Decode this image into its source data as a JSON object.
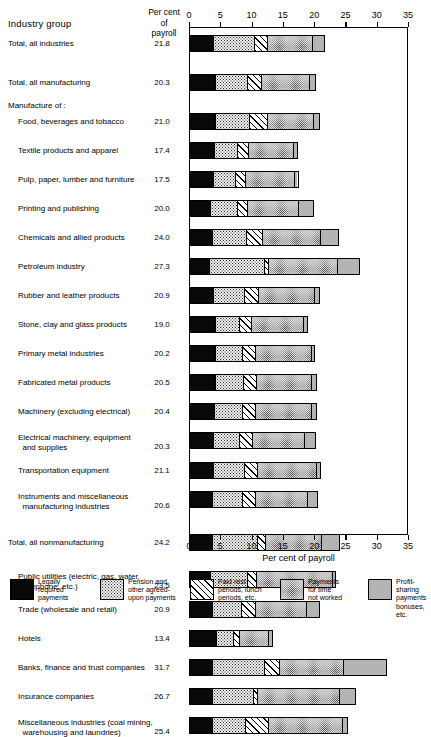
{
  "header": {
    "industry_group": "Industry group",
    "percent_of_payroll_l1": "Per cent",
    "percent_of_payroll_l2": "of",
    "percent_of_payroll_l3": "payroll"
  },
  "axis": {
    "caption": "Per cent of payroll",
    "ticks": [
      0,
      5,
      10,
      15,
      20,
      25,
      30,
      35
    ],
    "min": 0,
    "max": 35
  },
  "legend": {
    "items": [
      {
        "name": "legally-required",
        "label": "Legally\nrequired\npayments",
        "pattern": "p-legal",
        "color": "#080808"
      },
      {
        "name": "pension-agreed",
        "label": "Pension and\nother agreed-\nupon payments",
        "pattern": "p-pension",
        "color": "#f2f2f2"
      },
      {
        "name": "paid-rest",
        "label": "Paid rest\nperiods, lunch\nperiods, etc.",
        "pattern": "p-rest",
        "color": "#ffffff"
      },
      {
        "name": "time-not-worked",
        "label": "Payments\nfor time\nnot worked",
        "pattern": "p-time",
        "color": "#dedede"
      },
      {
        "name": "profit-sharing",
        "label": "Profit-sharing\npayments\nbonuses, etc.",
        "pattern": "p-profit",
        "color": "#b4b4b4"
      }
    ]
  },
  "group_headings": [
    {
      "label": "Manufacture of :",
      "after_row": 1
    }
  ],
  "chart_data": {
    "type": "bar",
    "orientation": "horizontal",
    "stacked": true,
    "title": "",
    "xlabel": "Per cent of payroll",
    "ylabel": "Industry group",
    "xlim": [
      0,
      35
    ],
    "grid": false,
    "legend_position": "bottom",
    "series": [
      {
        "name": "Legally required payments",
        "pattern": "p-legal"
      },
      {
        "name": "Pension and other agreed-upon payments",
        "pattern": "p-pension"
      },
      {
        "name": "Paid rest periods, lunch periods, etc.",
        "pattern": "p-rest"
      },
      {
        "name": "Payments for time not worked",
        "pattern": "p-time"
      },
      {
        "name": "Profit-sharing payments bonuses, etc.",
        "pattern": "p-profit"
      }
    ],
    "rows": [
      {
        "label": "Total, all industries",
        "indent": 0,
        "total": "21.8",
        "segments": [
          3.8,
          6.6,
          2.1,
          7.3,
          2.0
        ]
      },
      {
        "label": "Total, all manufacturing",
        "indent": 0,
        "total": "20.3",
        "segments": [
          4.0,
          5.2,
          2.3,
          7.8,
          1.0
        ]
      },
      {
        "label": "Food, beverages and tobacco",
        "indent": 1,
        "total": "21.0",
        "segments": [
          4.0,
          5.5,
          3.0,
          7.5,
          1.0
        ]
      },
      {
        "label": "Textile products and apparel",
        "indent": 1,
        "total": "17.4",
        "segments": [
          3.9,
          3.8,
          1.8,
          7.2,
          0.7
        ]
      },
      {
        "label": "Pulp, paper, lumber and furniture",
        "indent": 1,
        "total": "17.5",
        "segments": [
          3.8,
          3.6,
          1.6,
          8.0,
          0.5
        ]
      },
      {
        "label": "Printing and publishing",
        "indent": 1,
        "total": "20.0",
        "segments": [
          3.3,
          4.3,
          1.7,
          8.3,
          2.4
        ]
      },
      {
        "label": "Chemicals and allied products",
        "indent": 1,
        "total": "24.0",
        "segments": [
          3.6,
          5.4,
          2.6,
          9.4,
          3.0
        ]
      },
      {
        "label": "Petroleum industry",
        "indent": 1,
        "total": "27.3",
        "segments": [
          3.0,
          9.0,
          0.6,
          11.2,
          3.5
        ]
      },
      {
        "label": "Rubber and leather products",
        "indent": 1,
        "total": "20.9",
        "segments": [
          3.7,
          5.1,
          2.3,
          9.0,
          0.8
        ]
      },
      {
        "label": "Stone, clay and glass products",
        "indent": 1,
        "total": "19.0",
        "segments": [
          4.0,
          3.9,
          2.0,
          8.5,
          0.6
        ]
      },
      {
        "label": "Primary metal industries",
        "indent": 1,
        "total": "20.2",
        "segments": [
          4.1,
          4.4,
          2.0,
          9.1,
          0.6
        ]
      },
      {
        "label": "Fabricated metal products",
        "indent": 1,
        "total": "20.5",
        "segments": [
          4.0,
          4.6,
          2.1,
          9.0,
          0.8
        ]
      },
      {
        "label": "Machinery (excluding electrical)",
        "indent": 1,
        "total": "20.4",
        "segments": [
          3.9,
          4.6,
          2.0,
          9.2,
          0.7
        ]
      },
      {
        "label": "Electrical machinery, equipment\n  and supplies",
        "indent": 1,
        "total": "20.3",
        "segments": [
          3.8,
          4.2,
          2.1,
          8.4,
          1.8
        ]
      },
      {
        "label": "Transportation equipment",
        "indent": 1,
        "total": "21.1",
        "segments": [
          3.8,
          4.9,
          2.2,
          9.5,
          0.7
        ]
      },
      {
        "label": "Instruments and miscellaneous\n  manufacturing industries",
        "indent": 1,
        "total": "20.6",
        "segments": [
          3.6,
          4.8,
          2.2,
          8.4,
          1.6
        ]
      },
      {
        "label": "Total, all nonmanufacturing",
        "indent": 0,
        "total": "24.2",
        "segments": [
          3.6,
          7.2,
          1.4,
          9.0,
          3.0
        ]
      },
      {
        "label": "Public utilities (electric, gas, water,\n  telephone, etc.)",
        "indent": 1,
        "total": "23.5",
        "segments": [
          3.3,
          6.0,
          1.4,
          12.3,
          0.5
        ]
      },
      {
        "label": "Trade (wholesale and retail)",
        "indent": 1,
        "total": "20.9",
        "segments": [
          3.5,
          4.8,
          2.2,
          8.4,
          2.0
        ]
      },
      {
        "label": "Hotels",
        "indent": 1,
        "total": "13.4",
        "segments": [
          4.2,
          2.8,
          1.0,
          4.8,
          0.6
        ]
      },
      {
        "label": "Banks, finance and trust companies",
        "indent": 1,
        "total": "31.7",
        "segments": [
          3.6,
          8.4,
          2.4,
          10.3,
          7.0
        ]
      },
      {
        "label": "Insurance companies",
        "indent": 1,
        "total": "26.7",
        "segments": [
          3.6,
          6.6,
          0.7,
          13.2,
          2.6
        ]
      },
      {
        "label": "Miscellaneous industries (coal mining,\n  warehousing and laundries)",
        "indent": 1,
        "total": "25.4",
        "segments": [
          3.5,
          5.4,
          3.8,
          11.9,
          0.8
        ]
      }
    ]
  }
}
